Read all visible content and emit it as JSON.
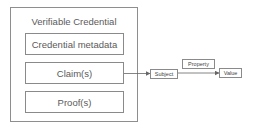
{
  "diagram": {
    "container": {
      "label": "Verifiable Credential"
    },
    "components": [
      {
        "label": "Credential metadata"
      },
      {
        "label": "Claim(s)"
      },
      {
        "label": "Proof(s)"
      }
    ],
    "graph": {
      "subject": "Subject",
      "property": "Property",
      "value": "Value"
    },
    "edges": [
      {
        "from": "Claim(s)",
        "to": "Subject"
      },
      {
        "from": "Subject",
        "to": "Value",
        "label": "Property"
      }
    ],
    "colors": {
      "stroke": "#8a8a8a",
      "text": "#555555",
      "background": "#ffffff"
    }
  }
}
